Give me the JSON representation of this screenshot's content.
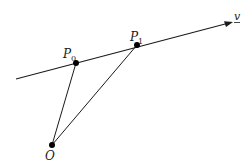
{
  "diagram": {
    "line": {
      "label": "v",
      "start": [
        16,
        79
      ],
      "end": [
        233,
        22
      ]
    },
    "points": [
      {
        "id": "P0",
        "label": "P",
        "subscript": "0",
        "x": 76,
        "y": 63
      },
      {
        "id": "P1",
        "label": "P",
        "subscript": "1",
        "x": 137,
        "y": 45
      },
      {
        "id": "O",
        "label": "O",
        "subscript": "",
        "x": 52,
        "y": 145
      }
    ],
    "segments": [
      {
        "from": "O",
        "to": "P0"
      },
      {
        "from": "O",
        "to": "P1"
      }
    ],
    "colors": {
      "stroke": "#1a1a1a",
      "point": "#000000",
      "background": "#ffffff"
    }
  }
}
